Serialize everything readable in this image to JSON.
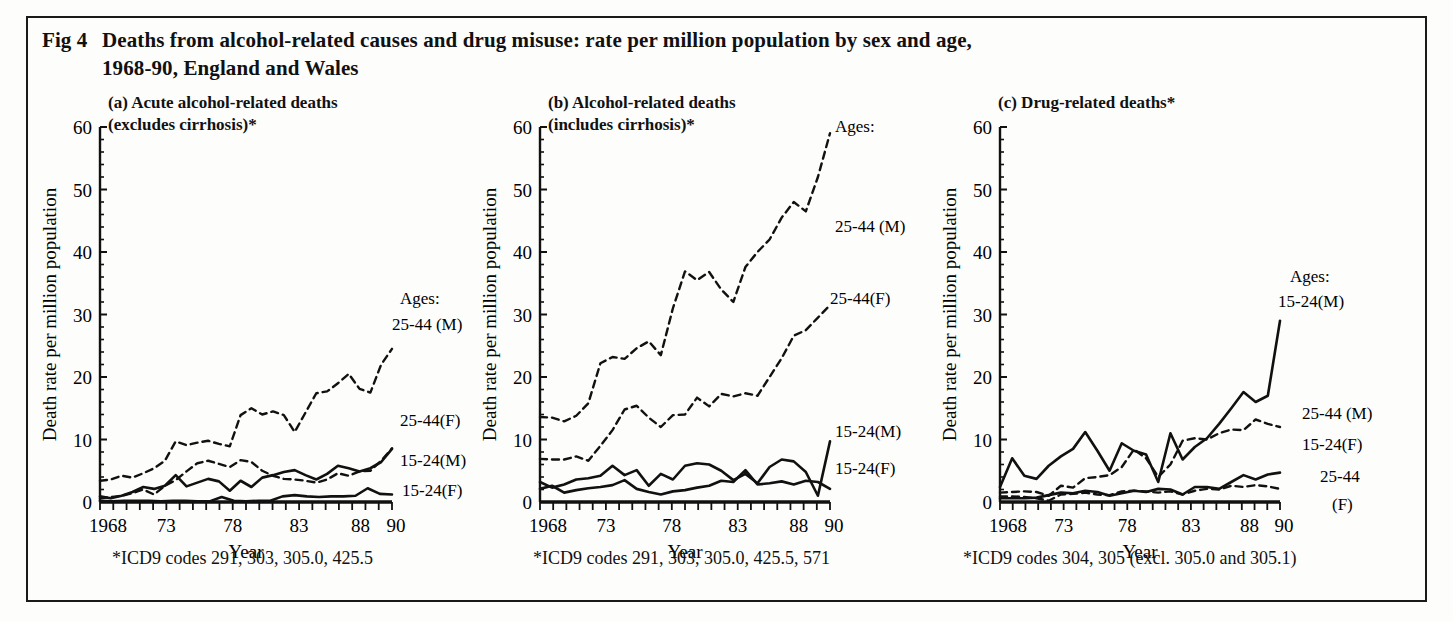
{
  "figure": {
    "label": "Fig 4",
    "title_line1": "Deaths from alcohol-related causes and drug misuse: rate per million population by sex and age,",
    "title_line2": "1968-90, England and Wales"
  },
  "common": {
    "ylabel": "Death rate per million population",
    "xlabel": "Year",
    "ytick_labels": [
      "0",
      "10",
      "20",
      "30",
      "40",
      "50",
      "60"
    ],
    "xtick_labels": [
      "1968",
      "73",
      "78",
      "83",
      "88",
      "90"
    ],
    "ages_legend_header": "Ages:",
    "line_color": "#111111"
  },
  "panels": [
    {
      "id": "a",
      "title": "(a) Acute alcohol-related deaths\n(excludes cirrhosis)*",
      "footnote": "*ICD9 codes 291, 303, 305.0, 425.5",
      "labels": {
        "ages": "Ages:",
        "s1": "25-44 (M)",
        "s2": "25-44(F)",
        "s3": "15-24(M)",
        "s4": "15-24(F)"
      }
    },
    {
      "id": "b",
      "title": "(b) Alcohol-related deaths\n(includes cirrhosis)*",
      "footnote": "*ICD9 codes 291, 303, 305.0, 425.5, 571",
      "labels": {
        "ages": "Ages:",
        "s1": "25-44 (M)",
        "s2": "25-44(F)",
        "s3": "15-24(M)",
        "s4": "15-24(F)"
      }
    },
    {
      "id": "c",
      "title": "(c) Drug-related deaths*",
      "footnote": "*ICD9 codes 304, 305 (excl. 305.0 and 305.1)",
      "labels": {
        "ages": "Ages:",
        "s1": "15-24(M)",
        "s2": "25-44 (M)",
        "s3": "15-24(F)",
        "s4a": "25-44",
        "s4b": "(F)"
      }
    }
  ],
  "chart_data": [
    {
      "type": "line",
      "panel": "a",
      "title": "(a) Acute alcohol-related deaths (excludes cirrhosis)*",
      "xlabel": "Year",
      "ylabel": "Death rate per million population",
      "xlim": [
        1968,
        1990
      ],
      "ylim": [
        0,
        60
      ],
      "grid": false,
      "legend_position": "inline-right",
      "x": [
        1968,
        1969,
        1970,
        1971,
        1972,
        1973,
        1974,
        1975,
        1976,
        1977,
        1978,
        1979,
        1980,
        1981,
        1982,
        1983,
        1984,
        1985,
        1986,
        1987,
        1988,
        1989,
        1990
      ],
      "series": [
        {
          "name": "25-44 (M)",
          "style": "dashed",
          "values": [
            3.4,
            3.6,
            4.2,
            3.9,
            4.6,
            5.4,
            6.6,
            9.7,
            9.1,
            9.5,
            9.8,
            9.3,
            8.9,
            13.9,
            15.0,
            14.0,
            14.5,
            13.9,
            11.2,
            14.3,
            17.4,
            17.7,
            19.0,
            20.5,
            18.1,
            17.5,
            22.0,
            24.5
          ]
        },
        {
          "name": "25-44(F)",
          "style": "dashed",
          "values": [
            0.6,
            0.8,
            1.0,
            1.4,
            2.0,
            1.2,
            2.6,
            3.5,
            4.9,
            6.2,
            6.6,
            6.1,
            5.6,
            6.7,
            6.4,
            5.0,
            4.2,
            3.7,
            3.6,
            3.4,
            3.1,
            3.6,
            4.6,
            4.2,
            4.9,
            5.0,
            6.6,
            8.6
          ]
        },
        {
          "name": "15-24(M)",
          "style": "solid",
          "values": [
            0.9,
            0.6,
            1.0,
            1.6,
            2.4,
            2.1,
            2.6,
            4.3,
            2.5,
            3.1,
            3.7,
            3.3,
            1.8,
            3.4,
            2.4,
            3.9,
            4.3,
            4.8,
            5.1,
            4.3,
            3.6,
            4.5,
            5.8,
            5.4,
            4.9,
            5.4,
            6.4,
            8.5
          ]
        },
        {
          "name": "15-24(F)",
          "style": "solid",
          "values": [
            0.2,
            0.1,
            0.2,
            0.2,
            0.2,
            0.1,
            0.2,
            0.2,
            0.1,
            0.1,
            0.8,
            0.2,
            0.1,
            0.2,
            0.2,
            0.9,
            1.1,
            0.9,
            0.8,
            0.9,
            0.9,
            1.0,
            2.2,
            1.3,
            1.2
          ]
        }
      ]
    },
    {
      "type": "line",
      "panel": "b",
      "title": "(b) Alcohol-related deaths (includes cirrhosis)*",
      "xlabel": "Year",
      "ylabel": "Death rate per million population",
      "xlim": [
        1968,
        1990
      ],
      "ylim": [
        0,
        60
      ],
      "grid": false,
      "legend_position": "inline-right",
      "x": [
        1968,
        1969,
        1970,
        1971,
        1972,
        1973,
        1974,
        1975,
        1976,
        1977,
        1978,
        1979,
        1980,
        1981,
        1982,
        1983,
        1984,
        1985,
        1986,
        1987,
        1988,
        1989,
        1990
      ],
      "series": [
        {
          "name": "25-44 (M)",
          "style": "dashed",
          "values": [
            13.6,
            13.5,
            12.9,
            13.8,
            15.8,
            22.2,
            23.2,
            22.9,
            24.6,
            25.7,
            23.5,
            31.0,
            36.9,
            35.5,
            36.8,
            34.0,
            32.0,
            37.6,
            40.0,
            42.0,
            45.5,
            48.0,
            46.5,
            52.0,
            59.0
          ]
        },
        {
          "name": "25-44(F)",
          "style": "dashed",
          "values": [
            6.9,
            6.8,
            6.8,
            7.3,
            6.6,
            9.0,
            11.5,
            14.8,
            15.4,
            13.5,
            12.0,
            13.9,
            14.0,
            16.7,
            15.3,
            17.3,
            16.9,
            17.4,
            17.0,
            20.0,
            23.0,
            26.6,
            27.5,
            29.5,
            31.5
          ]
        },
        {
          "name": "15-24(M)",
          "style": "solid",
          "values": [
            3.2,
            2.3,
            2.8,
            3.6,
            3.8,
            4.2,
            5.8,
            4.3,
            5.1,
            2.6,
            4.5,
            3.6,
            5.8,
            6.2,
            6.0,
            5.0,
            3.5,
            4.5,
            3.0,
            5.6,
            6.8,
            6.5,
            4.8,
            1.0,
            9.7
          ]
        },
        {
          "name": "15-24(F)",
          "style": "solid",
          "values": [
            2.1,
            2.6,
            1.5,
            1.9,
            2.2,
            2.4,
            2.7,
            3.5,
            2.1,
            1.6,
            1.2,
            1.7,
            1.9,
            2.3,
            2.6,
            3.4,
            3.2,
            5.1,
            2.8,
            3.0,
            3.3,
            2.8,
            3.4,
            3.2,
            2.1
          ]
        }
      ]
    },
    {
      "type": "line",
      "panel": "c",
      "title": "(c) Drug-related deaths*",
      "xlabel": "Year",
      "ylabel": "Death rate per million population",
      "xlim": [
        1968,
        1990
      ],
      "ylim": [
        0,
        60
      ],
      "grid": false,
      "legend_position": "inline-right",
      "x": [
        1968,
        1969,
        1970,
        1971,
        1972,
        1973,
        1974,
        1975,
        1976,
        1977,
        1978,
        1979,
        1980,
        1981,
        1982,
        1983,
        1984,
        1985,
        1986,
        1987,
        1988,
        1989,
        1990
      ],
      "series": [
        {
          "name": "15-24(M)",
          "style": "solid",
          "values": [
            2.4,
            7.0,
            4.2,
            3.7,
            5.8,
            7.3,
            8.5,
            11.2,
            8.2,
            5.0,
            9.4,
            8.2,
            7.6,
            3.2,
            11.0,
            6.8,
            8.8,
            10.2,
            12.5,
            15.0,
            17.6,
            16.0,
            17.0,
            29.0
          ]
        },
        {
          "name": "25-44 (M)",
          "style": "dashed",
          "values": [
            1.5,
            1.6,
            1.7,
            1.6,
            1.0,
            2.6,
            2.3,
            3.8,
            4.0,
            4.3,
            5.6,
            8.4,
            7.0,
            4.0,
            6.0,
            9.8,
            10.2,
            10.0,
            11.0,
            11.6,
            11.5,
            13.2,
            12.5,
            12.0
          ]
        },
        {
          "name": "15-24(F)",
          "style": "solid",
          "values": [
            0.6,
            0.6,
            0.6,
            0.7,
            1.1,
            1.5,
            1.4,
            1.8,
            1.6,
            1.0,
            1.4,
            1.8,
            1.6,
            2.1,
            2.0,
            1.2,
            2.4,
            2.4,
            2.1,
            3.2,
            4.3,
            3.6,
            4.4,
            4.7
          ]
        },
        {
          "name": "25-44 (F)",
          "style": "dashed",
          "values": [
            0.9,
            0.9,
            0.8,
            0.6,
            0.2,
            1.2,
            1.3,
            1.5,
            1.2,
            1.1,
            1.7,
            1.8,
            1.7,
            1.5,
            1.7,
            1.2,
            1.8,
            2.1,
            2.0,
            2.6,
            2.4,
            2.7,
            2.5,
            2.1
          ]
        }
      ]
    }
  ]
}
